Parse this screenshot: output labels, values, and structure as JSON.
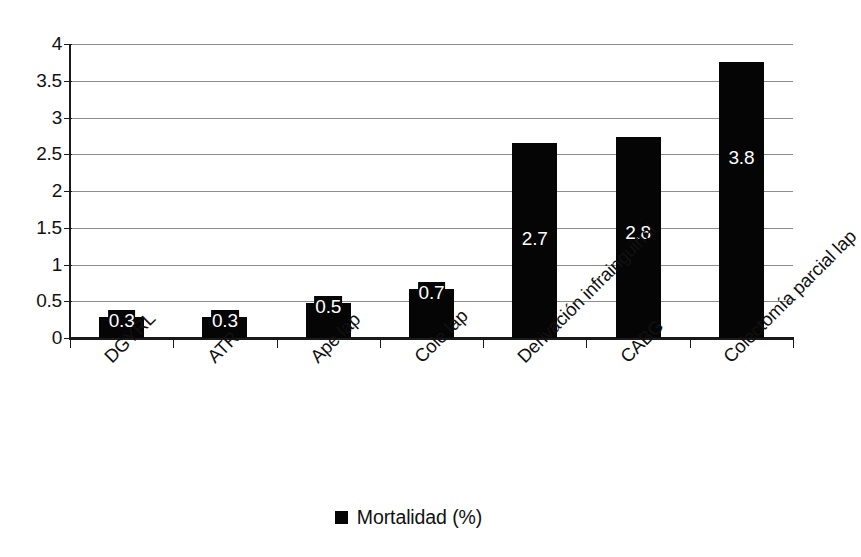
{
  "chart_data": {
    "type": "bar",
    "title": "",
    "subtitle": "",
    "xlabel": "",
    "ylabel": "",
    "ylim": [
      0,
      4
    ],
    "ytick_step": 0.5,
    "yticks": [
      "4",
      "3.5",
      "3",
      "2.5",
      "2",
      "1.5",
      "1",
      "0.5",
      "0"
    ],
    "ytick_values": [
      4,
      3.5,
      3,
      2.5,
      2,
      1.5,
      1,
      0.5,
      0
    ],
    "grid": "horizontal",
    "categories": [
      "DGYRL",
      "ATR",
      "Ape lap",
      "Cole lap",
      "Derivación infrainguinal",
      "CABG",
      "Colectomía parcial lap"
    ],
    "series": [
      {
        "name": "Mortalidad (%)",
        "color": "#050505",
        "values": [
          0.3,
          0.3,
          0.5,
          0.7,
          2.7,
          2.8,
          3.8
        ],
        "drawn_values": [
          0.29,
          0.28,
          0.48,
          0.67,
          2.65,
          2.73,
          3.75
        ],
        "labels": [
          "0.3",
          "0.3",
          "0.5",
          "0.7",
          "2.7",
          "2.8",
          "3.8"
        ]
      }
    ],
    "legend": {
      "position": "bottom-center",
      "entries": [
        {
          "label": "Mortalidad (%)",
          "marker": "filled-square",
          "color": "#050505"
        }
      ]
    },
    "axis_color": "#1a1a1a",
    "gridline_color": "#8d8d8d",
    "background": "#ffffff"
  },
  "legend": {
    "label": "Mortalidad (%)",
    "marker_name": "legend-square-marker"
  }
}
